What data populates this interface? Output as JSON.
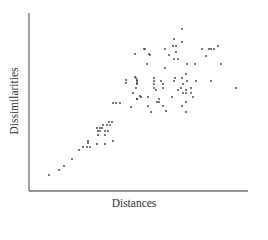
{
  "chart_data": {
    "type": "scatter",
    "title": "",
    "xlabel": "Distances",
    "ylabel": "Dissimilarities",
    "grid": false,
    "legend": null,
    "ticks": "none",
    "axis_pixel_frame": {
      "x0": 29,
      "x1": 248,
      "y_top": 13,
      "y_bottom": 191
    },
    "point_color": "#3a3a3a",
    "axis_color": "#6f6f6f",
    "points_px": [
      [
        49,
        175
      ],
      [
        59,
        170
      ],
      [
        64,
        166
      ],
      [
        72,
        159
      ],
      [
        79,
        150
      ],
      [
        83,
        147
      ],
      [
        87,
        147
      ],
      [
        90,
        147
      ],
      [
        88,
        143
      ],
      [
        88,
        141
      ],
      [
        97,
        144
      ],
      [
        105,
        144
      ],
      [
        113,
        141
      ],
      [
        97,
        128
      ],
      [
        100,
        128
      ],
      [
        103,
        125
      ],
      [
        107,
        125
      ],
      [
        109,
        122
      ],
      [
        112,
        122
      ],
      [
        98,
        131
      ],
      [
        100,
        131
      ],
      [
        105,
        131
      ],
      [
        108,
        131
      ],
      [
        98,
        135
      ],
      [
        105,
        135
      ],
      [
        102,
        128
      ],
      [
        110,
        125
      ],
      [
        113,
        103
      ],
      [
        116,
        103
      ],
      [
        120,
        103
      ],
      [
        126,
        80
      ],
      [
        126,
        83
      ],
      [
        135,
        77
      ],
      [
        137,
        80
      ],
      [
        137,
        83
      ],
      [
        133,
        93
      ],
      [
        140,
        96
      ],
      [
        137,
        99
      ],
      [
        131,
        107
      ],
      [
        135,
        54
      ],
      [
        144,
        49
      ],
      [
        149,
        54
      ],
      [
        147,
        64
      ],
      [
        182,
        29
      ],
      [
        174,
        39
      ],
      [
        182,
        42
      ],
      [
        173,
        46
      ],
      [
        176,
        46
      ],
      [
        145,
        49
      ],
      [
        165,
        49
      ],
      [
        176,
        52
      ],
      [
        150,
        55
      ],
      [
        169,
        55
      ],
      [
        174,
        59
      ],
      [
        178,
        59
      ],
      [
        202,
        49
      ],
      [
        209,
        49
      ],
      [
        211,
        49
      ],
      [
        214,
        49
      ],
      [
        218,
        46
      ],
      [
        206,
        56
      ],
      [
        187,
        64
      ],
      [
        195,
        64
      ],
      [
        221,
        64
      ],
      [
        165,
        68
      ],
      [
        186,
        74
      ],
      [
        136,
        78
      ],
      [
        154,
        78
      ],
      [
        175,
        78
      ],
      [
        182,
        78
      ],
      [
        137,
        81
      ],
      [
        154,
        81
      ],
      [
        161,
        81
      ],
      [
        174,
        81
      ],
      [
        187,
        81
      ],
      [
        196,
        81
      ],
      [
        211,
        81
      ],
      [
        137,
        84
      ],
      [
        154,
        84
      ],
      [
        163,
        84
      ],
      [
        183,
        84
      ],
      [
        136,
        88
      ],
      [
        154,
        88
      ],
      [
        163,
        88
      ],
      [
        181,
        88
      ],
      [
        186,
        90
      ],
      [
        178,
        90
      ],
      [
        191,
        88
      ],
      [
        236,
        88
      ],
      [
        156,
        90
      ],
      [
        183,
        93
      ],
      [
        186,
        93
      ],
      [
        191,
        93
      ],
      [
        141,
        97
      ],
      [
        148,
        97
      ],
      [
        172,
        97
      ],
      [
        193,
        97
      ],
      [
        137,
        99
      ],
      [
        159,
        99
      ],
      [
        157,
        102
      ],
      [
        159,
        102
      ],
      [
        186,
        102
      ],
      [
        148,
        106
      ],
      [
        163,
        106
      ],
      [
        182,
        106
      ],
      [
        151,
        112
      ],
      [
        166,
        111
      ],
      [
        186,
        112
      ]
    ]
  }
}
